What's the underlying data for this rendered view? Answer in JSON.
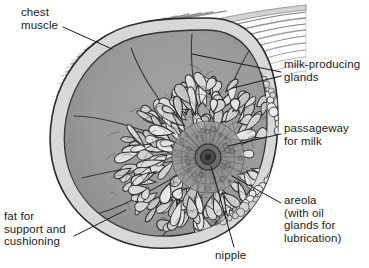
{
  "figure": {
    "kind": "anatomical-cross-section",
    "background_color": "#ffffff",
    "ink_color": "#1b1b1b",
    "tissue_fill": "#9a9a9a",
    "lobule_fill": "#c8c8c8",
    "fat_cell_fill": "#e8e8e8",
    "areola_fill": "#8b8b8b",
    "nipple_fill": "#4a4a4a"
  },
  "labels": {
    "chest_muscle": "chest\nmuscle",
    "milk_glands": "milk-producing\nglands",
    "passageway": "passageway\nfor milk",
    "areola": "areola\n(with oil\nglands for\nlubrication)",
    "nipple": "nipple",
    "fat": "fat for\nsupport and\ncushioning"
  },
  "parts": [
    {
      "id": "chest-muscle",
      "label": "chest muscle",
      "position": "upper-left striated hatching"
    },
    {
      "id": "milk-producing-glands",
      "label": "milk-producing glands",
      "position": "lobules filling breast interior"
    },
    {
      "id": "passageway-for-milk",
      "label": "passageway for milk",
      "position": "ducts radiating to nipple"
    },
    {
      "id": "areola",
      "label": "areola (with oil glands for lubrication)",
      "position": "ring around nipple"
    },
    {
      "id": "nipple",
      "label": "nipple",
      "position": "center of areola"
    },
    {
      "id": "fat",
      "label": "fat for support and cushioning",
      "position": "outer ring of round cells"
    }
  ]
}
